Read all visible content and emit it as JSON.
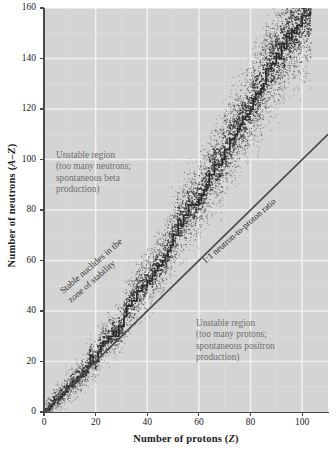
{
  "chart_data": {
    "type": "scatter",
    "title": "",
    "xlabel": "Number of protons (Z)",
    "ylabel": "Number of neutrons (A–Z)",
    "xlim": [
      0,
      110
    ],
    "ylim": [
      0,
      160
    ],
    "xticks": [
      0,
      20,
      40,
      60,
      80,
      100
    ],
    "yticks": [
      0,
      20,
      40,
      60,
      80,
      100,
      120,
      140,
      160
    ],
    "grid": true,
    "legend": "none",
    "series": [
      {
        "name": "Stable nuclides (zone of stability)",
        "type": "scatter",
        "description": "Dense band of dotted points curving upward from the origin, bending above the 1:1 line as Z increases",
        "points": [
          [
            1,
            0
          ],
          [
            1,
            1
          ],
          [
            2,
            2
          ],
          [
            3,
            3
          ],
          [
            4,
            5
          ],
          [
            5,
            5
          ],
          [
            6,
            6
          ],
          [
            7,
            7
          ],
          [
            8,
            8
          ],
          [
            9,
            10
          ],
          [
            10,
            10
          ],
          [
            11,
            12
          ],
          [
            12,
            12
          ],
          [
            13,
            14
          ],
          [
            14,
            14
          ],
          [
            15,
            16
          ],
          [
            16,
            16
          ],
          [
            17,
            18
          ],
          [
            18,
            22
          ],
          [
            19,
            20
          ],
          [
            20,
            20
          ],
          [
            21,
            24
          ],
          [
            22,
            26
          ],
          [
            23,
            28
          ],
          [
            24,
            28
          ],
          [
            25,
            30
          ],
          [
            26,
            30
          ],
          [
            27,
            32
          ],
          [
            28,
            30
          ],
          [
            29,
            34
          ],
          [
            30,
            34
          ],
          [
            31,
            38
          ],
          [
            32,
            42
          ],
          [
            33,
            42
          ],
          [
            34,
            44
          ],
          [
            35,
            44
          ],
          [
            36,
            48
          ],
          [
            37,
            48
          ],
          [
            38,
            50
          ],
          [
            39,
            50
          ],
          [
            40,
            52
          ],
          [
            41,
            52
          ],
          [
            42,
            54
          ],
          [
            43,
            56
          ],
          [
            44,
            58
          ],
          [
            45,
            58
          ],
          [
            46,
            60
          ],
          [
            47,
            62
          ],
          [
            48,
            64
          ],
          [
            49,
            66
          ],
          [
            50,
            70
          ],
          [
            51,
            70
          ],
          [
            52,
            76
          ],
          [
            53,
            74
          ],
          [
            54,
            78
          ],
          [
            55,
            78
          ],
          [
            56,
            82
          ],
          [
            57,
            82
          ],
          [
            58,
            82
          ],
          [
            59,
            82
          ],
          [
            60,
            84
          ],
          [
            61,
            86
          ],
          [
            62,
            88
          ],
          [
            63,
            90
          ],
          [
            64,
            94
          ],
          [
            65,
            94
          ],
          [
            66,
            98
          ],
          [
            67,
            98
          ],
          [
            68,
            98
          ],
          [
            69,
            100
          ],
          [
            70,
            104
          ],
          [
            71,
            104
          ],
          [
            72,
            108
          ],
          [
            73,
            108
          ],
          [
            74,
            110
          ],
          [
            75,
            112
          ],
          [
            76,
            114
          ],
          [
            77,
            116
          ],
          [
            78,
            117
          ],
          [
            79,
            118
          ],
          [
            80,
            120
          ],
          [
            81,
            124
          ],
          [
            82,
            126
          ],
          [
            83,
            126
          ],
          [
            84,
            128
          ],
          [
            85,
            130
          ],
          [
            86,
            136
          ],
          [
            87,
            136
          ],
          [
            88,
            138
          ],
          [
            89,
            138
          ],
          [
            90,
            142
          ],
          [
            91,
            140
          ],
          [
            92,
            146
          ],
          [
            93,
            144
          ],
          [
            94,
            150
          ],
          [
            95,
            148
          ],
          [
            96,
            151
          ],
          [
            97,
            150
          ],
          [
            98,
            153
          ],
          [
            99,
            153
          ],
          [
            100,
            157
          ],
          [
            101,
            157
          ],
          [
            102,
            157
          ],
          [
            103,
            159
          ]
        ]
      },
      {
        "name": "1:1 neutron-to-proton ratio",
        "type": "line",
        "x": [
          0,
          110
        ],
        "y": [
          0,
          110
        ]
      }
    ],
    "annotations": [
      {
        "name": "unstable-too-many-neutrons",
        "text": "Unstable region\n(too many neutrons;\nspontaneous beta\nproduction)",
        "x": 10,
        "y": 104
      },
      {
        "name": "unstable-too-many-protons",
        "text": "Unstable region\n(too many protons;\nspontaneous positron\nproduction)",
        "x": 62,
        "y": 38
      },
      {
        "name": "stable-zone",
        "text": "Stable nuclides in the\nzone of stability",
        "x": 18,
        "y": 58,
        "rotation": -41
      },
      {
        "name": "ratio-line-label",
        "text": "1:1 neutron-to-proton ratio",
        "x": 62,
        "y": 62,
        "rotation": -41
      }
    ],
    "colors": {
      "plot_background": "#d4d4d4",
      "gridline": "#efefef",
      "axis": "#4a4a4a",
      "data_points": "#3a3a3a",
      "ratio_line": "#4a4a4a",
      "note_text": "#6e6e6e"
    }
  },
  "axes": {
    "x": {
      "title_main": "Number of protons (",
      "title_var": "Z",
      "title_end": ")",
      "ticks": [
        "0",
        "20",
        "40",
        "60",
        "80",
        "100"
      ]
    },
    "y": {
      "title_main": "Number of neutrons (",
      "title_var": "A–Z",
      "title_end": ")",
      "ticks": [
        "0",
        "20",
        "40",
        "60",
        "80",
        "100",
        "120",
        "140",
        "160"
      ]
    }
  },
  "notes": {
    "neutron_rich": "Unstable region\n(too many neutrons;\nspontaneous beta\nproduction)",
    "proton_rich": "Unstable region\n(too many protons;\nspontaneous positron\nproduction)",
    "stable_zone": "Stable nuclides in the\nzone of stability",
    "ratio_line": "1:1 neutron-to-proton ratio"
  }
}
